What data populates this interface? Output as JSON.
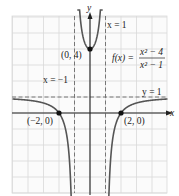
{
  "chart_data": {
    "type": "line",
    "title": "",
    "function_label": {
      "name": "f(x) =",
      "numerator": "x² − 4",
      "denominator": "x² − 1"
    },
    "xlabel": "x",
    "ylabel": "y",
    "xlim": [
      -5,
      5
    ],
    "ylim": [
      -5,
      6
    ],
    "grid": true,
    "asymptotes": [
      {
        "type": "vertical",
        "value": -1,
        "label": "x = −1"
      },
      {
        "type": "vertical",
        "value": 1,
        "label": "x = 1"
      },
      {
        "type": "horizontal",
        "value": 1,
        "label": "y = 1"
      }
    ],
    "points": [
      {
        "x": 0,
        "y": 4,
        "label": "(0, 4)"
      },
      {
        "x": -2,
        "y": 0,
        "label": "(−2, 0)"
      },
      {
        "x": 2,
        "y": 0,
        "label": "(2, 0)"
      }
    ],
    "series": [
      {
        "name": "f(x) = (x^2-4)/(x^2-1)",
        "expression": "(x*x-4)/(x*x-1)"
      }
    ],
    "colors": {
      "curve": "#555555",
      "axis": "#222222",
      "grid": "#d9d9d9",
      "asymptote": "#777777",
      "point": "#111111"
    }
  }
}
